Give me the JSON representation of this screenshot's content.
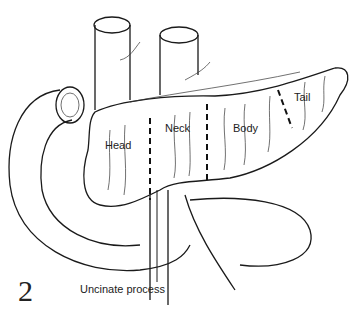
{
  "figure": {
    "number": "2",
    "labels": {
      "head": "Head",
      "neck": "Neck",
      "body": "Body",
      "tail": "Tail",
      "uncinate": "Uncinate process"
    }
  }
}
